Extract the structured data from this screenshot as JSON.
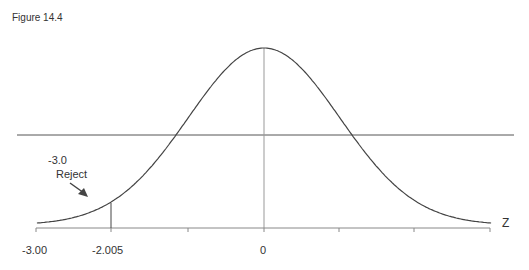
{
  "figure_label": "Figure 14.4",
  "annotation": {
    "line1": "-3.0",
    "line2": "Reject"
  },
  "axis": {
    "label": "Z",
    "ticks": [
      "-3.00",
      "-2.005",
      "0"
    ]
  },
  "chart_data": {
    "type": "line",
    "title": "Figure 14.4",
    "xlabel": "Z",
    "ylabel": "",
    "x_tick_labels": [
      {
        "position": -3.0,
        "label": "-3.00"
      },
      {
        "position": -2.0,
        "label": "-2.005"
      },
      {
        "position": 0,
        "label": "0"
      }
    ],
    "tick_marks": [
      -3,
      -2,
      -1,
      0,
      1,
      2,
      3
    ],
    "xlim": [
      -3,
      3
    ],
    "critical_value_line": -2.0,
    "horizontal_reference_line": true,
    "annotations": [
      {
        "text": "-3.0 Reject",
        "arrow_to": "left tail"
      }
    ],
    "grid": false,
    "legend": null
  }
}
